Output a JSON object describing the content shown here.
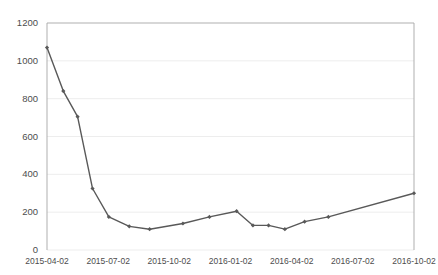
{
  "chart_data": {
    "type": "line",
    "title": "",
    "subtitle": "",
    "xlabel": "",
    "ylabel": "",
    "grid": true,
    "legend": false,
    "legend_position": "none",
    "line_color": "#595959",
    "marker_color": "#595959",
    "axis_color": "#a6a6a6",
    "grid_color": "#e8e8e8",
    "text_color": "#4d4d4d",
    "ylim": [
      0,
      1200
    ],
    "yticks": [
      0,
      200,
      400,
      600,
      800,
      1000,
      1200
    ],
    "ytick_labels": [
      "0",
      "200",
      "400",
      "600",
      "800",
      "1000",
      "1200"
    ],
    "xtick_labels": [
      "2015-04-02",
      "2015-07-02",
      "2015-10-02",
      "2016-01-02",
      "2016-04-02",
      "2016-07-02",
      "2016-10-02"
    ],
    "xtick_positions": [
      0,
      9,
      18,
      27,
      36,
      45,
      54
    ],
    "xlim": [
      0,
      54
    ],
    "series": [
      {
        "name": "series-1",
        "x": [
          0,
          2.4,
          4.5,
          6.7,
          9.1,
          12.1,
          15.1,
          20.0,
          23.9,
          27.9,
          30.3,
          32.6,
          35.0,
          37.9,
          41.4,
          54.0
        ],
        "values": [
          1070,
          840,
          705,
          325,
          175,
          125,
          110,
          140,
          175,
          205,
          130,
          130,
          110,
          150,
          175,
          300
        ]
      }
    ]
  }
}
